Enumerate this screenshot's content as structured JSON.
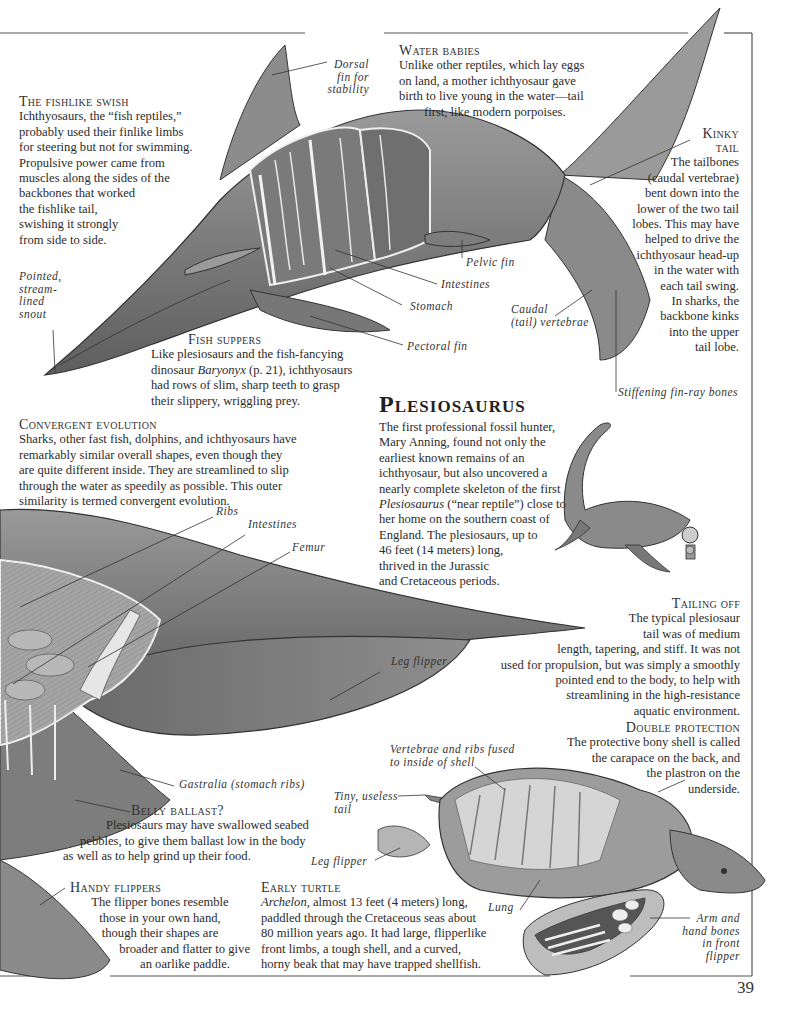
{
  "page": {
    "number": "39"
  },
  "ichthyosaur": {
    "labels": {
      "dorsal": [
        "Dorsal",
        "fin for",
        "stability"
      ],
      "snout": [
        "Pointed,",
        "stream-",
        "lined",
        "snout"
      ],
      "pelvic": "Pelvic fin",
      "intestines": "Intestines",
      "stomach": "Stomach",
      "pectoral": "Pectoral fin",
      "caudal": [
        "Caudal",
        "(tail) vertebrae"
      ],
      "finray": "Stiffening fin-ray bones"
    },
    "fishlike_swish": {
      "heading": "The fishlike swish",
      "lines": [
        "Ichthyosaurs, the “fish reptiles,”",
        "probably used their finlike limbs",
        "for steering but not for swimming.",
        "Propulsive power came from",
        "muscles along the sides of the",
        "backbones that worked",
        "the fishlike tail,",
        "swishing it strongly",
        "from side to side."
      ]
    },
    "water_babies": {
      "heading": "Water babies",
      "lines": [
        "Unlike other reptiles, which lay eggs",
        "on land, a mother ichthyosaur gave",
        "birth to live young in the water—tail",
        "first, like modern porpoises."
      ]
    },
    "kinky_tail": {
      "heading1": "Kinky",
      "heading2": "tail",
      "lines": [
        "The tailbones",
        "(caudal vertebrae)",
        "bent down into the",
        "lower of the two tail",
        "lobes. This may have",
        "helped to drive the",
        "ichthyosaur head-up",
        "in the water with",
        "each tail swing.",
        "In sharks, the",
        "backbone kinks",
        "into the upper",
        "tail lobe."
      ]
    },
    "fish_suppers": {
      "heading": "Fish suppers",
      "line1": "Like plesiosaurs and the fish-fancying",
      "line2_pre": "dinosaur ",
      "line2_italic": "Baryonyx",
      "line2_post": " (p. 21), ichthyosaurs",
      "line3": "had rows of slim, sharp teeth to grasp",
      "line4": "their slippery, wriggling prey."
    }
  },
  "convergent": {
    "heading": "Convergent evolution",
    "lines": [
      "Sharks, other fast fish, dolphins, and ichthyosaurs have",
      "remarkably similar overall shapes, even though they",
      "are quite different inside. They are streamlined to slip",
      "through the water as speedily as possible. This outer",
      "similarity is termed convergent evolution."
    ]
  },
  "plesiosaurus": {
    "title": "Plesiosaurus",
    "lines": [
      "The first professional fossil hunter,",
      "Mary Anning, found not only the",
      "earliest known remains of an",
      "ichthyosaur, but also uncovered a",
      "nearly complete skeleton of the first"
    ],
    "italic_word": "Plesiosaurus",
    "italic_rest": " (“near reptile”) close to",
    "lines2": [
      "her home on the southern coast of",
      "England. The plesiosaurs, up to",
      "46 feet (14 meters) long,",
      "thrived in the Jurassic",
      "and Cretaceous periods."
    ],
    "labels": {
      "ribs": "Ribs",
      "intestines": "Intestines",
      "femur": "Femur",
      "leg_flipper": "Leg flipper",
      "gastralia": "Gastralia (stomach ribs)"
    }
  },
  "tailing_off": {
    "heading": "Tailing off",
    "lines": [
      "The typical plesiosaur",
      "tail was of medium",
      "length, tapering, and stiff. It was not",
      "used for propulsion, but was simply a smoothly",
      "pointed end to the body, to help with",
      "streamlining in the high-resistance",
      "aquatic environment."
    ]
  },
  "belly_ballast": {
    "heading": "Belly ballast?",
    "lines": [
      "Plesiosaurs may have swallowed seabed",
      "pebbles, to give them ballast low in the body",
      "as well as to help grind up their food."
    ]
  },
  "handy_flippers": {
    "heading": "Handy flippers",
    "lines": [
      "The flipper bones resemble",
      "those in your own hand,",
      "though their shapes are",
      "broader and flatter to give",
      "an oarlike paddle."
    ]
  },
  "double_protection": {
    "heading": "Double protection",
    "lines": [
      "The protective bony shell is called",
      "the carapace on the back, and",
      "the plastron on the",
      "underside."
    ]
  },
  "early_turtle": {
    "heading": "Early turtle",
    "italic": "Archelon",
    "line1_rest": ", almost 13 feet (4 meters) long,",
    "lines": [
      "paddled through the Cretaceous seas about",
      "80 million years ago. It had large, flipperlike",
      "front limbs, a tough shell, and a curved,",
      "horny beak that may have trapped shellfish."
    ],
    "labels": {
      "vertebrae": [
        "Vertebrae and ribs fused",
        "to inside of shell"
      ],
      "tail": [
        "Tiny, useless",
        "tail"
      ],
      "leg_flipper": "Leg flipper",
      "lung": "Lung",
      "arm": [
        "Arm and",
        "hand bones",
        "in front",
        "flipper"
      ]
    }
  }
}
